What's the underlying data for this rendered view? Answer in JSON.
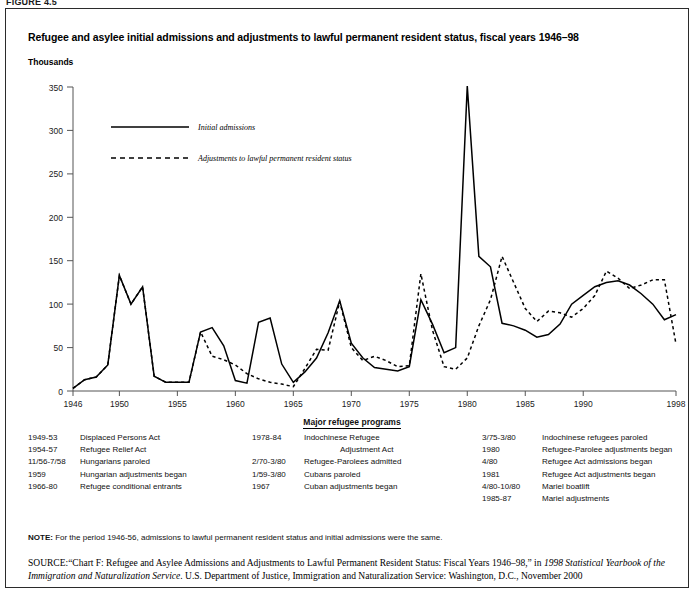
{
  "figure_tag": "FIGURE 4.5",
  "title": "Refugee and asylee initial admissions and adjustments to lawful permanent resident status, fiscal years 1946–98",
  "yaxis_unit": "Thousands",
  "legend": {
    "series1": "Initial admissions",
    "series2": "Adjustments to lawful permanent  resident status"
  },
  "programs": {
    "heading": "Major refugee programs",
    "rows": [
      {
        "c1_period": "1949-53",
        "c1_label": "Displaced Persons Act",
        "c1_indent": false,
        "c2_period": "1978-84",
        "c2_label": "Indochinese Refugee",
        "c2_indent": false,
        "c3_period": "3/75-3/80",
        "c3_label": "Indochinese refugees paroled",
        "c3_indent": false
      },
      {
        "c1_period": "1954-57",
        "c1_label": "Refugee Relief Act",
        "c1_indent": false,
        "c2_period": "",
        "c2_label": "Adjustment Act",
        "c2_indent": true,
        "c3_period": "1980",
        "c3_label": "Refugee-Parolee adjustments began",
        "c3_indent": false
      },
      {
        "c1_period": "11/56-7/58",
        "c1_label": "Hungarians paroled",
        "c1_indent": false,
        "c2_period": "2/70-3/80",
        "c2_label": "Refugee-Parolees admitted",
        "c2_indent": false,
        "c3_period": "4/80",
        "c3_label": "Refugee Act admissions began",
        "c3_indent": false
      },
      {
        "c1_period": "1959",
        "c1_label": "Hungarian adjustments began",
        "c1_indent": false,
        "c2_period": "1/59-3/80",
        "c2_label": "Cubans paroled",
        "c2_indent": false,
        "c3_period": "1981",
        "c3_label": "Refugee Act adjustments began",
        "c3_indent": false
      },
      {
        "c1_period": "1966-80",
        "c1_label": "Refugee conditional entrants",
        "c1_indent": false,
        "c2_period": "1967",
        "c2_label": "Cuban adjustments began",
        "c2_indent": false,
        "c3_period": "4/80-10/80",
        "c3_label": "Mariel boatlift",
        "c3_indent": false
      },
      {
        "c1_period": "",
        "c1_label": "",
        "c1_indent": false,
        "c2_period": "",
        "c2_label": "",
        "c2_indent": false,
        "c3_period": "1985-87",
        "c3_label": "Mariel adjustments",
        "c3_indent": false
      }
    ]
  },
  "note_label": "NOTE:",
  "note_text": "For the period 1946-56, admissions to lawful permanent resident status and initial admissions were the same.",
  "source_label": "SOURCE:",
  "source_text_1": "“Chart F: Refugee and Asylee Admissions and Adjustments to Lawful Permanent Resident Status: Fiscal Years 1946–98,” in ",
  "source_italic_1": "1998 Statistical Yearbook of the Immigration and Naturalization Service",
  "source_text_2": ". U.S. Department of Justice, Immigration and Naturalization Service: Washington, D.C., November 2000",
  "chart_data": {
    "type": "line",
    "title": "Refugee and asylee initial admissions and adjustments to lawful permanent resident status, fiscal years 1946–98",
    "xlabel": "",
    "ylabel": "Thousands",
    "xlim": [
      1946,
      1998
    ],
    "ylim": [
      0,
      350
    ],
    "yticks": [
      0,
      50,
      100,
      150,
      200,
      250,
      300,
      350
    ],
    "xticks": [
      1946,
      1950,
      1955,
      1960,
      1965,
      1970,
      1975,
      1980,
      1985,
      1990,
      1998
    ],
    "grid": false,
    "legend_position": "upper-left-inside",
    "x": [
      1946,
      1947,
      1948,
      1949,
      1950,
      1951,
      1952,
      1953,
      1954,
      1955,
      1956,
      1957,
      1958,
      1959,
      1960,
      1961,
      1962,
      1963,
      1964,
      1965,
      1966,
      1967,
      1968,
      1969,
      1970,
      1971,
      1972,
      1973,
      1974,
      1975,
      1976,
      1977,
      1978,
      1979,
      1980,
      1981,
      1982,
      1983,
      1984,
      1985,
      1986,
      1987,
      1988,
      1989,
      1990,
      1991,
      1992,
      1993,
      1994,
      1995,
      1996,
      1997,
      1998
    ],
    "series": [
      {
        "name": "Initial admissions",
        "style": "solid",
        "values": [
          3,
          13,
          16,
          30,
          133,
          100,
          120,
          17,
          10,
          10,
          10,
          68,
          73,
          52,
          12,
          9,
          79,
          84,
          31,
          10,
          22,
          38,
          67,
          104,
          55,
          38,
          27,
          25,
          23,
          28,
          105,
          77,
          44,
          50,
          351,
          155,
          143,
          78,
          75,
          70,
          62,
          65,
          77,
          100,
          110,
          120,
          125,
          127,
          122,
          112,
          100,
          82,
          88
        ]
      },
      {
        "name": "Adjustments to lawful permanent resident status",
        "style": "dashed",
        "values": [
          3,
          13,
          16,
          30,
          133,
          100,
          120,
          17,
          10,
          10,
          10,
          68,
          40,
          36,
          30,
          20,
          14,
          10,
          8,
          5,
          26,
          48,
          47,
          103,
          50,
          35,
          40,
          35,
          28,
          29,
          135,
          70,
          28,
          25,
          38,
          75,
          105,
          155,
          125,
          95,
          80,
          92,
          90,
          85,
          95,
          110,
          138,
          130,
          118,
          122,
          128,
          128,
          54
        ]
      }
    ]
  }
}
